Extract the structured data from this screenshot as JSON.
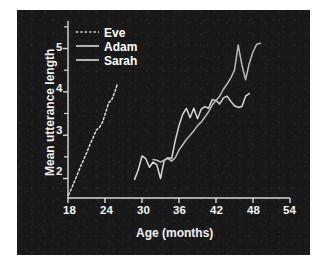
{
  "figure": {
    "background": "#ffffff",
    "panel_color": "#191919",
    "line_color": "#d8d8d8",
    "text_color": "#f2f2f2"
  },
  "chart_data": {
    "type": "line",
    "title": "",
    "xlabel": "Age (months)",
    "ylabel": "Mean utterance length",
    "xlim": [
      18,
      54
    ],
    "ylim": [
      1.55,
      5.45
    ],
    "xticks": [
      18,
      24,
      30,
      36,
      42,
      48,
      54
    ],
    "xticklabels": [
      "18",
      "24",
      "30",
      "36",
      "42",
      "48",
      "54"
    ],
    "yticks": [
      2,
      3,
      4,
      5
    ],
    "yticklabels": [
      "2",
      "3",
      "4",
      "5"
    ],
    "yminorticks": [
      2.5,
      3.5,
      4.5,
      5.5
    ],
    "grid": false,
    "legend_position": "top-left-inside",
    "series": [
      {
        "name": "Eve",
        "style": "dashed",
        "color": "#d8d8d8",
        "x": [
          18.1,
          18.6,
          19.1,
          19.6,
          20.1,
          20.6,
          21.1,
          21.6,
          22.1,
          22.6,
          23.1,
          23.6,
          24.1,
          24.6,
          25.1,
          25.6,
          26.0
        ],
        "y": [
          1.62,
          1.78,
          1.95,
          2.12,
          2.3,
          2.45,
          2.62,
          2.8,
          2.95,
          3.12,
          3.18,
          3.3,
          3.52,
          3.75,
          3.82,
          4.0,
          4.18
        ]
      },
      {
        "name": "Adam",
        "style": "solid",
        "color": "#d8d8d8",
        "x": [
          28.8,
          29.4,
          30.0,
          30.6,
          31.2,
          31.8,
          32.4,
          33.0,
          33.6,
          34.2,
          34.8,
          35.4,
          36.0,
          36.6,
          37.2,
          37.8,
          38.4,
          39.0,
          39.6,
          40.2,
          40.8,
          41.4,
          42.0,
          42.6,
          43.2,
          43.8,
          44.4,
          45.0,
          45.6,
          46.2,
          46.8,
          47.4
        ],
        "y": [
          1.98,
          2.2,
          2.52,
          2.46,
          2.26,
          2.38,
          2.32,
          2.0,
          2.42,
          2.48,
          2.46,
          2.88,
          3.22,
          3.48,
          3.62,
          3.4,
          3.62,
          3.38,
          3.6,
          3.66,
          3.62,
          3.82,
          3.8,
          3.72,
          3.86,
          3.9,
          3.78,
          3.68,
          3.64,
          3.66,
          3.9,
          3.96
        ]
      },
      {
        "name": "Sarah",
        "style": "solid",
        "color": "#b9b9b9",
        "x": [
          31.8,
          32.4,
          33.0,
          33.6,
          34.2,
          34.8,
          35.4,
          36.0,
          36.6,
          37.2,
          37.8,
          38.4,
          39.0,
          39.6,
          40.2,
          40.8,
          41.4,
          42.0,
          42.6,
          43.2,
          43.8,
          44.4,
          45.0,
          45.6,
          46.2,
          46.8,
          47.4,
          48.0,
          48.6,
          49.2
        ],
        "y": [
          2.44,
          2.42,
          2.38,
          2.42,
          2.46,
          2.4,
          2.48,
          2.66,
          2.78,
          2.9,
          3.0,
          3.1,
          3.22,
          3.3,
          3.42,
          3.54,
          3.7,
          3.8,
          3.9,
          4.06,
          4.18,
          4.32,
          4.5,
          5.08,
          4.62,
          4.28,
          4.66,
          4.92,
          5.1,
          5.12
        ]
      }
    ]
  },
  "legend": {
    "items": [
      {
        "label": "Eve",
        "style": "dashed"
      },
      {
        "label": "Adam",
        "style": "solid"
      },
      {
        "label": "Sarah",
        "style": "solid"
      }
    ]
  }
}
